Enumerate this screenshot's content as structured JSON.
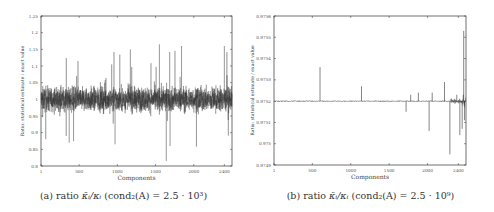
{
  "chart_data": [
    {
      "id": "a",
      "type": "line",
      "title": "",
      "caption": "(a) ratio κ̄ᵢ/κᵢ (cond₂(A) = 2.5 · 10³)",
      "caption_parts": {
        "label": "(a)",
        "text": "ratio",
        "math": "κ̄ᵢ/κᵢ",
        "cond": "(cond₂(A) = 2.5 · 10³)"
      },
      "xlabel": "Components",
      "ylabel": "Ratio: statistical estimate / exact value",
      "xlim": [
        1,
        2500
      ],
      "ylim": [
        0.8,
        1.25
      ],
      "xticks": [
        1,
        500,
        1000,
        1500,
        2000,
        2400
      ],
      "xtick_labels": [
        "1",
        "500",
        "1000",
        "1500",
        "2000",
        "2400"
      ],
      "yticks": [
        0.8,
        0.85,
        0.9,
        0.95,
        1.0,
        1.05,
        1.1,
        1.15,
        1.2,
        1.25
      ],
      "ytick_labels": [
        "0.8",
        "0.85",
        "0.9",
        "0.95",
        "1",
        "1.05",
        "1.1",
        "1.15",
        "1.2",
        "1.25"
      ],
      "grid": false,
      "legend": null,
      "series": [
        {
          "name": "ratio",
          "description": "Dense noisy signal centered at 1.0, typical band 0.92–1.08, extremes ~0.82–1.17",
          "mean": 1.0,
          "typical_range": [
            0.92,
            1.08
          ],
          "extreme_range": [
            0.815,
            1.17
          ],
          "notable_points": [
            {
              "x": 1640,
              "y": 0.815
            },
            {
              "x": 1550,
              "y": 1.165
            },
            {
              "x": 1170,
              "y": 1.15
            },
            {
              "x": 1840,
              "y": 1.16
            },
            {
              "x": 2400,
              "y": 1.16
            },
            {
              "x": 370,
              "y": 0.87
            },
            {
              "x": 970,
              "y": 0.865
            },
            {
              "x": 1690,
              "y": 0.86
            }
          ]
        }
      ],
      "line_color": "#333333"
    },
    {
      "id": "b",
      "type": "line",
      "title": "",
      "caption": "(b) ratio κ̄ᵢ/κᵢ (cond₂(A) = 2.5 · 10⁹)",
      "caption_parts": {
        "label": "(b)",
        "text": "ratio",
        "math": "κ̄ᵢ/κᵢ",
        "cond": "(cond₂(A) = 2.5 · 10⁹)"
      },
      "xlabel": "Components",
      "ylabel": "Ratio: statistical estimate / exact value",
      "xlim": [
        1,
        2500
      ],
      "ylim": [
        0.9749,
        0.9756
      ],
      "xticks": [
        1,
        500,
        1000,
        1500,
        2000,
        2400
      ],
      "xtick_labels": [
        "1",
        "500",
        "1000",
        "1500",
        "2000",
        "2400"
      ],
      "yticks": [
        0.9749,
        0.975,
        0.9751,
        0.9752,
        0.9753,
        0.9754,
        0.9755,
        0.9756
      ],
      "ytick_labels": [
        "0.9749",
        "0.975",
        "0.9751",
        "0.9752",
        "0.9753",
        "0.9754",
        "0.9755",
        "0.9756"
      ],
      "grid": false,
      "legend": null,
      "series": [
        {
          "name": "ratio",
          "baseline": 0.9752,
          "spikes": [
            {
              "x": 600,
              "y": 0.97536
            },
            {
              "x": 1140,
              "y": 0.97527
            },
            {
              "x": 1720,
              "y": 0.97515
            },
            {
              "x": 1780,
              "y": 0.97523
            },
            {
              "x": 1880,
              "y": 0.97524
            },
            {
              "x": 2020,
              "y": 0.97506
            },
            {
              "x": 2060,
              "y": 0.97524
            },
            {
              "x": 2220,
              "y": 0.97529
            },
            {
              "x": 2290,
              "y": 0.97495
            },
            {
              "x": 2380,
              "y": 0.97523
            },
            {
              "x": 2420,
              "y": 0.97504
            },
            {
              "x": 2450,
              "y": 0.97507
            },
            {
              "x": 2470,
              "y": 0.97553
            },
            {
              "x": 2480,
              "y": 0.97511
            }
          ]
        }
      ],
      "line_color": "#333333"
    }
  ]
}
